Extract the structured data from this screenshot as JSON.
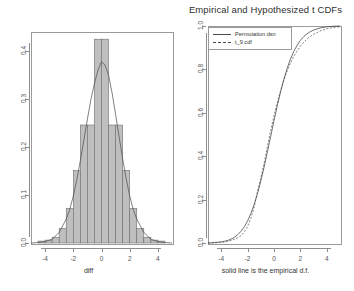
{
  "figure": {
    "background": "#ffffff",
    "width": 354,
    "height": 291
  },
  "panels": {
    "left": {
      "title": "",
      "xlabel": "diff",
      "ylabel": "",
      "xticks": [
        "-4",
        "-2",
        "0",
        "2",
        "4"
      ],
      "yticks": [
        "0.0",
        "0.1",
        "0.2",
        "0.3",
        "0.4"
      ]
    },
    "right": {
      "title": "Empirical and Hypothesized t CDFs",
      "xlabel": "solid line is the empirical d.f.",
      "ylabel": "",
      "xticks": [
        "-4",
        "-2",
        "0",
        "2",
        "4"
      ],
      "yticks": [
        "0.0",
        "0.2",
        "0.4",
        "0.6",
        "0.8",
        "1.0"
      ],
      "legend": {
        "entries": [
          {
            "label": "Permutation dsn",
            "style": "solid"
          },
          {
            "label": "t_9 cdf",
            "style": "dashed"
          }
        ]
      }
    }
  },
  "colors": {
    "bar_fill": "#bfbfbf",
    "bar_border": "#6e6e6e",
    "curve": "#4a4a4a",
    "axis": "#8d8d8d",
    "text": "#3a3a3a"
  },
  "chart_data": [
    {
      "type": "bar",
      "title": "",
      "xlabel": "diff",
      "ylabel": "",
      "xlim": [
        -5.0,
        5.0
      ],
      "ylim": [
        0.0,
        0.44
      ],
      "grid": false,
      "bin_width": 0.5,
      "categories": [
        "-4.25",
        "-3.75",
        "-3.25",
        "-2.75",
        "-2.25",
        "-1.75",
        "-1.25",
        "-0.75",
        "-0.25",
        "0.25",
        "0.75",
        "1.25",
        "1.75",
        "2.25",
        "2.75",
        "3.25",
        "3.75",
        "4.25"
      ],
      "bin_edges": [
        -4.5,
        -4.0,
        -3.5,
        -3.0,
        -2.5,
        -2.0,
        -1.5,
        -1.0,
        -0.5,
        0.0,
        0.5,
        1.0,
        1.5,
        2.0,
        2.5,
        3.0,
        3.5,
        4.0,
        4.5
      ],
      "values": [
        0.004,
        0.006,
        0.012,
        0.03,
        0.072,
        0.151,
        0.246,
        0.246,
        0.425,
        0.425,
        0.246,
        0.246,
        0.151,
        0.072,
        0.03,
        0.012,
        0.006,
        0.004
      ],
      "overlay": {
        "name": "normal density curve",
        "type": "line",
        "x": [
          -5.0,
          -4.5,
          -4.0,
          -3.5,
          -3.0,
          -2.5,
          -2.25,
          -2.0,
          -1.75,
          -1.5,
          -1.25,
          -1.0,
          -0.75,
          -0.5,
          -0.25,
          0.0,
          0.25,
          0.5,
          0.75,
          1.0,
          1.25,
          1.5,
          1.75,
          2.0,
          2.25,
          2.5,
          3.0,
          3.5,
          4.0,
          4.5,
          5.0
        ],
        "y": [
          0.0,
          0.001,
          0.003,
          0.008,
          0.022,
          0.05,
          0.07,
          0.098,
          0.132,
          0.172,
          0.215,
          0.258,
          0.299,
          0.333,
          0.36,
          0.378,
          0.371,
          0.35,
          0.313,
          0.268,
          0.221,
          0.176,
          0.134,
          0.098,
          0.07,
          0.05,
          0.022,
          0.008,
          0.003,
          0.001,
          0.0
        ]
      }
    },
    {
      "type": "line",
      "title": "Empirical and Hypothesized t CDFs",
      "xlabel": "solid line is the empirical d.f.",
      "ylabel": "",
      "xlim": [
        -5.0,
        5.0
      ],
      "ylim": [
        0.0,
        1.0
      ],
      "grid": false,
      "legend_position": "top-left",
      "series": [
        {
          "name": "Permutation dsn",
          "style": "solid",
          "x": [
            -5.0,
            -4.5,
            -4.0,
            -3.75,
            -3.5,
            -3.25,
            -3.0,
            -2.75,
            -2.5,
            -2.25,
            -2.0,
            -1.75,
            -1.5,
            -1.25,
            -1.0,
            -0.75,
            -0.5,
            -0.25,
            0.0,
            0.25,
            0.5,
            0.75,
            1.0,
            1.25,
            1.5,
            1.75,
            2.0,
            2.25,
            2.5,
            2.75,
            3.0,
            3.5,
            4.0,
            4.5,
            5.0
          ],
          "y": [
            0.0,
            0.002,
            0.005,
            0.008,
            0.012,
            0.018,
            0.026,
            0.038,
            0.054,
            0.075,
            0.102,
            0.136,
            0.178,
            0.228,
            0.286,
            0.35,
            0.42,
            0.492,
            0.564,
            0.633,
            0.697,
            0.755,
            0.805,
            0.848,
            0.883,
            0.911,
            0.934,
            0.951,
            0.964,
            0.974,
            0.981,
            0.991,
            0.996,
            0.999,
            1.0
          ]
        },
        {
          "name": "t_9 cdf",
          "style": "dashed",
          "x": [
            -5.0,
            -4.5,
            -4.0,
            -3.75,
            -3.5,
            -3.25,
            -3.0,
            -2.75,
            -2.5,
            -2.25,
            -2.0,
            -1.75,
            -1.5,
            -1.25,
            -1.0,
            -0.75,
            -0.5,
            -0.25,
            0.0,
            0.25,
            0.5,
            0.75,
            1.0,
            1.25,
            1.5,
            1.75,
            2.0,
            2.25,
            2.5,
            2.75,
            3.0,
            3.5,
            4.0,
            4.5,
            5.0
          ],
          "y": [
            0.0,
            0.001,
            0.003,
            0.005,
            0.008,
            0.012,
            0.017,
            0.024,
            0.034,
            0.051,
            0.077,
            0.114,
            0.167,
            0.238,
            0.298,
            0.367,
            0.444,
            0.519,
            0.586,
            0.648,
            0.703,
            0.752,
            0.794,
            0.83,
            0.86,
            0.885,
            0.907,
            0.925,
            0.94,
            0.952,
            0.962,
            0.977,
            0.987,
            0.993,
            0.997
          ]
        }
      ]
    }
  ]
}
